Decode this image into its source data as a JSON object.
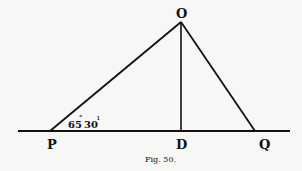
{
  "figure": {
    "caption": "Fig. 50.",
    "points": {
      "O": {
        "label": "O",
        "x": 181,
        "y": 22
      },
      "P": {
        "label": "P",
        "x": 50,
        "y": 131
      },
      "D": {
        "label": "D",
        "x": 181,
        "y": 131
      },
      "Q": {
        "label": "Q",
        "x": 255,
        "y": 131
      }
    },
    "angle_label": {
      "degrees": "65",
      "minutes": "30",
      "text": "65°30′"
    },
    "baseline": {
      "x1": 18,
      "x2": 290,
      "y": 131
    },
    "line_color": "#111111"
  }
}
